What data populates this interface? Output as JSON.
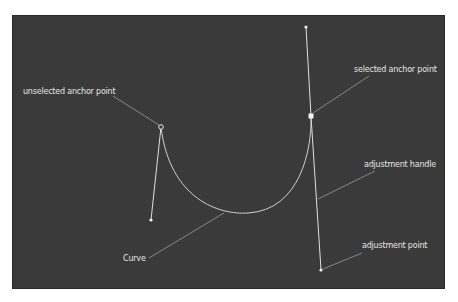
{
  "diagram": {
    "background_color": "#3a3a3a",
    "stroke_color": "#dcdcdc",
    "labels": {
      "unselected_anchor": "unselected anchor point",
      "selected_anchor": "selected anchor point",
      "adjustment_handle": "adjustment handle",
      "adjustment_point": "adjustment point",
      "curve": "Curve"
    },
    "points": {
      "unselected_anchor": [
        161,
        127
      ],
      "unselected_handle_end": [
        151,
        220
      ],
      "selected_anchor": [
        311,
        116
      ],
      "top_handle_end": [
        306,
        27
      ],
      "bottom_adjustment_point": [
        321,
        270
      ]
    }
  }
}
